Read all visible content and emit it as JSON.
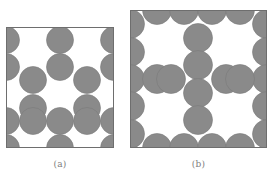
{
  "figure": {
    "background_color": "#ffffff",
    "circle_fill": "#8a8a8a",
    "circle_stroke": "#7a7a7a",
    "box_stroke": "#6e6e6e",
    "caption_color": "#7d7d7d",
    "panels": [
      {
        "id": "panel-a",
        "caption": "(a)",
        "box": {
          "x": 6,
          "y": 27,
          "width": 108,
          "height": 121
        },
        "circle_radius": 13.5,
        "circles": [
          {
            "cx": 6,
            "cy": 40
          },
          {
            "cx": 6,
            "cy": 67
          },
          {
            "cx": 6,
            "cy": 121
          },
          {
            "cx": 6,
            "cy": 148
          },
          {
            "cx": 33,
            "cy": 80
          },
          {
            "cx": 33,
            "cy": 108
          },
          {
            "cx": 33,
            "cy": 121
          },
          {
            "cx": 60,
            "cy": 40
          },
          {
            "cx": 60,
            "cy": 67
          },
          {
            "cx": 60,
            "cy": 121
          },
          {
            "cx": 60,
            "cy": 148
          },
          {
            "cx": 87,
            "cy": 80
          },
          {
            "cx": 87,
            "cy": 108
          },
          {
            "cx": 87,
            "cy": 121
          },
          {
            "cx": 114,
            "cy": 40
          },
          {
            "cx": 114,
            "cy": 67
          },
          {
            "cx": 114,
            "cy": 121
          },
          {
            "cx": 114,
            "cy": 148
          }
        ]
      },
      {
        "id": "panel-b",
        "caption": "(b)",
        "box": {
          "x": 130,
          "y": 10,
          "width": 137,
          "height": 138
        },
        "circle_radius": 14.5,
        "circles": [
          {
            "cx": 130,
            "cy": 24
          },
          {
            "cx": 130,
            "cy": 52
          },
          {
            "cx": 130,
            "cy": 79
          },
          {
            "cx": 130,
            "cy": 106
          },
          {
            "cx": 130,
            "cy": 134
          },
          {
            "cx": 267,
            "cy": 24
          },
          {
            "cx": 267,
            "cy": 52
          },
          {
            "cx": 267,
            "cy": 79
          },
          {
            "cx": 267,
            "cy": 106
          },
          {
            "cx": 267,
            "cy": 134
          },
          {
            "cx": 157,
            "cy": 10
          },
          {
            "cx": 184,
            "cy": 10
          },
          {
            "cx": 212,
            "cy": 10
          },
          {
            "cx": 240,
            "cy": 10
          },
          {
            "cx": 157,
            "cy": 148
          },
          {
            "cx": 184,
            "cy": 148
          },
          {
            "cx": 212,
            "cy": 148
          },
          {
            "cx": 240,
            "cy": 148
          },
          {
            "cx": 198,
            "cy": 38
          },
          {
            "cx": 198,
            "cy": 65
          },
          {
            "cx": 198,
            "cy": 93
          },
          {
            "cx": 198,
            "cy": 120
          },
          {
            "cx": 157,
            "cy": 79
          },
          {
            "cx": 171,
            "cy": 79
          },
          {
            "cx": 226,
            "cy": 79
          },
          {
            "cx": 240,
            "cy": 79
          }
        ]
      }
    ]
  }
}
